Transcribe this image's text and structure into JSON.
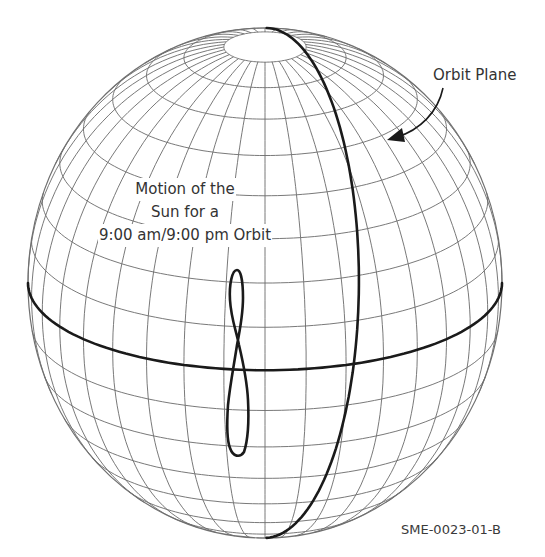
{
  "figure": {
    "id_label": "SME-0023-01-B",
    "labels": {
      "orbit_plane": "Orbit Plane",
      "sun_motion": [
        "Motion of the",
        "Sun for a",
        "9:00 am/9:00 pm Orbit"
      ]
    },
    "sphere": {
      "center": [
        265,
        283
      ],
      "rx": 237,
      "ry": 255,
      "tilt_deg": 20,
      "meridian_step_deg": 10,
      "parallel_step_deg": 10
    },
    "colors": {
      "grid": "#6a6a6a",
      "thick_line": "#1a1a1a",
      "text": "#333333",
      "background": "#ffffff"
    }
  }
}
